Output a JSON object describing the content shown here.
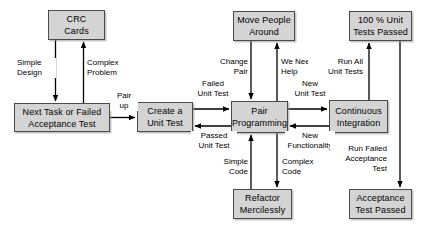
{
  "diagram": {
    "type": "flowchart",
    "colors": {
      "node_fill": "#d4d4d4",
      "node_border": "#4a4a4a",
      "edge": "#000000",
      "background": "#ffffff",
      "text": "#000000"
    },
    "nodes": [
      {
        "id": "crc_cards",
        "label": "CRC\nCards",
        "x": 48,
        "y": 10,
        "w": 57,
        "h": 30
      },
      {
        "id": "next_task",
        "label": "Next Task or Failed\nAcceptance Test",
        "x": 14,
        "y": 103,
        "w": 96,
        "h": 29
      },
      {
        "id": "create_unit_test",
        "label": "Create a\nUnit Test",
        "x": 137,
        "y": 102,
        "w": 56,
        "h": 30
      },
      {
        "id": "move_people",
        "label": "Move People\nAround",
        "x": 233,
        "y": 11,
        "w": 62,
        "h": 30
      },
      {
        "id": "pair_programming",
        "label": "Pair\nProgramming",
        "x": 231,
        "y": 101,
        "w": 57,
        "h": 32
      },
      {
        "id": "refactor",
        "label": "Refactor\nMercilessly",
        "x": 233,
        "y": 189,
        "w": 59,
        "h": 30
      },
      {
        "id": "unit_tests_passed",
        "label": "100 % Unit\nTests Passed",
        "x": 349,
        "y": 11,
        "w": 63,
        "h": 30
      },
      {
        "id": "continuous_integration",
        "label": "Continuous\nIntegration",
        "x": 329,
        "y": 100,
        "w": 59,
        "h": 33
      },
      {
        "id": "acceptance_passed",
        "label": "Acceptance\nTest Passed",
        "x": 349,
        "y": 189,
        "w": 63,
        "h": 30
      }
    ],
    "edges": [
      {
        "id": "e_crc_to_next",
        "from": "crc_cards",
        "to": "next_task",
        "label": "Simple\nDesign"
      },
      {
        "id": "e_next_to_crc",
        "from": "next_task",
        "to": "crc_cards",
        "label": "Complex\nProblem"
      },
      {
        "id": "e_next_to_create",
        "from": "next_task",
        "to": "create_unit_test",
        "label": "Pair\nup"
      },
      {
        "id": "e_create_to_pair",
        "from": "create_unit_test",
        "to": "pair_programming",
        "label": "Failed\nUnit Test"
      },
      {
        "id": "e_pair_to_create",
        "from": "pair_programming",
        "to": "create_unit_test",
        "label": "Passed\nUnit Test"
      },
      {
        "id": "e_move_to_pair",
        "from": "move_people",
        "to": "pair_programming",
        "label": "Change\nPair"
      },
      {
        "id": "e_pair_to_move",
        "from": "pair_programming",
        "to": "move_people",
        "label": "We Need\nHelp"
      },
      {
        "id": "e_refactor_to_pair",
        "from": "refactor",
        "to": "pair_programming",
        "label": "Simple\nCode"
      },
      {
        "id": "e_pair_to_refactor",
        "from": "pair_programming",
        "to": "refactor",
        "label": "Complex\nCode"
      },
      {
        "id": "e_pair_to_ci",
        "from": "pair_programming",
        "to": "continuous_integration",
        "label": "New\nUnit Test"
      },
      {
        "id": "e_ci_to_pair",
        "from": "continuous_integration",
        "to": "pair_programming",
        "label": "New\nFunctionality"
      },
      {
        "id": "e_ci_to_tests_passed",
        "from": "continuous_integration",
        "to": "unit_tests_passed",
        "label": "Run All\nUnit Tests"
      },
      {
        "id": "e_tests_to_acceptance",
        "from": "unit_tests_passed",
        "to": "acceptance_passed",
        "label": "Run Failed\nAcceptance\nTest"
      }
    ],
    "edge_labels": {
      "simple_design": "Simple\nDesign",
      "complex_problem": "Complex\nProblem",
      "pair_up": "Pair\nup",
      "failed_unit_test": "Failed\nUnit Test",
      "passed_unit_test": "Passed\nUnit Test",
      "change_pair": "Change\nPair",
      "we_need_help": "We Need\nHelp",
      "simple_code": "Simple\nCode",
      "complex_code": "Complex\nCode",
      "new_unit_test": "New\nUnit Test",
      "new_functionality": "New\nFunctionality",
      "run_all_unit_tests": "Run All\nUnit Tests",
      "run_failed_acceptance_test": "Run Failed\nAcceptance\nTest"
    }
  }
}
